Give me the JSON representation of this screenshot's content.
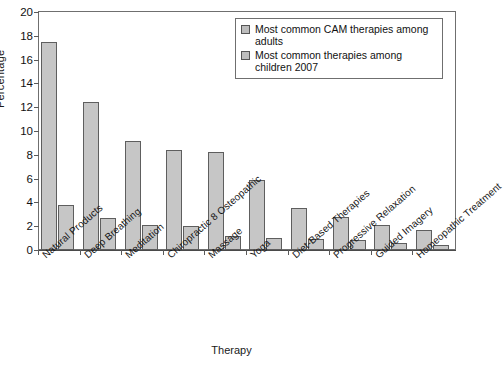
{
  "chart_data": {
    "type": "bar",
    "title": "",
    "xlabel": "Therapy",
    "ylabel": "Percentage",
    "ylim": [
      0,
      20
    ],
    "yticks": [
      0,
      2,
      4,
      6,
      8,
      10,
      12,
      14,
      16,
      18,
      20
    ],
    "grid": false,
    "legend_position": "top-right",
    "categories": [
      "Natural Products",
      "Deep Breathing",
      "Meditation",
      "Chiropractic 8 Osteopathic",
      "Massage",
      "Yoga",
      "Diet-Based Therapies",
      "Progressive Relaxation",
      "Guided Imagery",
      "Homeopathic Treatment"
    ],
    "series": [
      {
        "name": "Most common CAM therapies among adults",
        "values": [
          17.5,
          12.4,
          9.2,
          8.4,
          8.2,
          5.9,
          3.5,
          2.8,
          2.1,
          1.7
        ]
      },
      {
        "name": "Most common therapies among children 2007",
        "values": [
          3.8,
          2.7,
          2.1,
          2.0,
          1.2,
          1.0,
          0.9,
          0.8,
          0.6,
          0.4
        ]
      }
    ],
    "colors": {
      "bar_fill": "#c6c6c6",
      "bar_stroke": "#5e5e5e",
      "axis": "#4a4a4a",
      "background": "#ffffff"
    }
  },
  "legend": {
    "entries": [
      "Most common CAM therapies among adults",
      "Most common therapies among children 2007"
    ]
  },
  "axes": {
    "y_title": "Percentage",
    "x_title": "Therapy"
  }
}
